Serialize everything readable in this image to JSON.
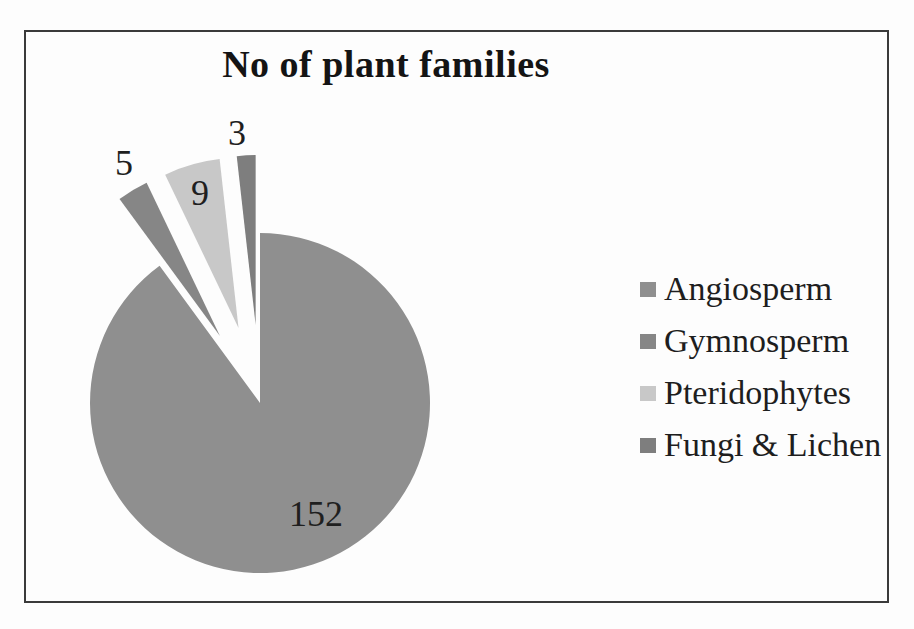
{
  "figure": {
    "background_color": "#fdfdfd",
    "frame_border_color": "#3a3a3a"
  },
  "chart_data": {
    "type": "pie",
    "title": "No of plant families",
    "categories": [
      "Angiosperm",
      "Gymnosperm",
      "Pteridophytes",
      "Fungi & Lichen"
    ],
    "values": [
      152,
      5,
      9,
      3
    ],
    "data_labels": [
      "152",
      "5",
      "9",
      "3"
    ],
    "colors": [
      "#8f8f8f",
      "#868686",
      "#c8c8c8",
      "#7e7e7e"
    ],
    "total": 169,
    "start_angle_deg": 0,
    "direction": "clockwise",
    "legend_position": "right",
    "grid": false,
    "layout": {
      "center_x": 260,
      "center_y": 403,
      "radius": 170,
      "explode_px": [
        0,
        78,
        78,
        78
      ],
      "label_positions": [
        [
          316,
          514
        ],
        [
          124,
          163
        ],
        [
          200,
          193
        ],
        [
          237,
          133
        ]
      ],
      "label_color": "#1f1f1f"
    }
  },
  "legend": {
    "items": [
      {
        "label": "Angiosperm",
        "color": "#8f8f8f"
      },
      {
        "label": "Gymnosperm",
        "color": "#868686"
      },
      {
        "label": "Pteridophytes",
        "color": "#c8c8c8"
      },
      {
        "label": "Fungi & Lichen",
        "color": "#7e7e7e"
      }
    ]
  }
}
